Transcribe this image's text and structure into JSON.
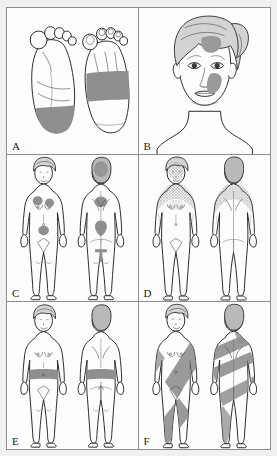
{
  "figure": {
    "layout": "2 columns x 3 rows grid of labelled illustration panels",
    "panel_count": 6,
    "style": "black and white line drawing with gray shaded lesion areas",
    "colors": {
      "page_background": "#efefef",
      "panel_background": "#fdfdfd",
      "frame_border": "#8d8d8d",
      "outline_ink": "#2a2a2a",
      "lesion_gray": "#8f8f8f",
      "hair_gray": "#d3d3d3",
      "shading_gray": "#dcdcdc",
      "label_text": "#1b1b1b"
    },
    "panels": [
      {
        "id": "A",
        "label": "A",
        "subject": "feet",
        "views": [
          "plantar (sole) view",
          "dorsal (top) view"
        ],
        "pattern": "transverse band across distal sole and across dorsum of foot",
        "lesion_regions": [
          "distal plantar surface / heel band",
          "mid-dorsum transverse band"
        ]
      },
      {
        "id": "B",
        "label": "B",
        "subject": "face",
        "views": [
          "three-quarter facial view of a woman"
        ],
        "pattern": "discrete patches on forehead and cheek",
        "lesion_regions": [
          "left forehead patch",
          "left malar / cheek patch"
        ]
      },
      {
        "id": "C",
        "label": "C",
        "subject": "whole body female figure",
        "views": [
          "anterior",
          "posterior"
        ],
        "pattern": "scattered discrete round plaques",
        "lesion_regions": [
          "scalp",
          "both breasts / upper chest",
          "lower abdomen",
          "upper back",
          "mid back",
          "sacrum"
        ]
      },
      {
        "id": "D",
        "label": "D",
        "subject": "whole body female figure",
        "views": [
          "anterior",
          "posterior"
        ],
        "pattern": "dense stippled / confluent papular eruption over sun-exposed upper trunk",
        "lesion_regions": [
          "face and neck",
          "upper chest and shoulders",
          "upper arms",
          "upper back"
        ]
      },
      {
        "id": "E",
        "label": "E",
        "subject": "whole body female figure",
        "views": [
          "anterior",
          "posterior"
        ],
        "pattern": "encircling band at the waistline (belt distribution)",
        "lesion_regions": [
          "circumferential waist band",
          "anterior waist",
          "posterior waist"
        ]
      },
      {
        "id": "F",
        "label": "F",
        "subject": "whole body female figure",
        "views": [
          "anterior",
          "posterior"
        ],
        "pattern": "broad oblique streaks following the lines of Blaschko",
        "lesion_regions": [
          "oblique stripe across anterior trunk and thigh",
          "V-shaped chevron streaks across the back",
          "streak over shoulder"
        ]
      }
    ]
  }
}
